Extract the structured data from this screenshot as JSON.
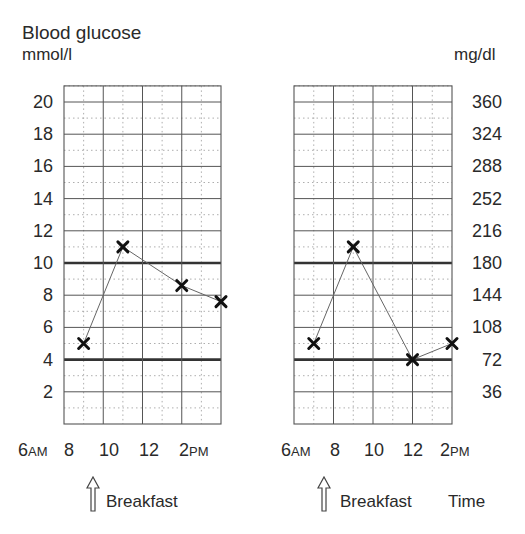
{
  "title": "Blood glucose",
  "unit_left": "mmol/l",
  "unit_right": "mg/dl",
  "y_ticks_left": [
    "20",
    "18",
    "16",
    "14",
    "12",
    "10",
    "8",
    "6",
    "4",
    "2"
  ],
  "y_ticks_right": [
    "360",
    "324",
    "288",
    "252",
    "216",
    "180",
    "144",
    "108",
    "72",
    "36"
  ],
  "x_ticks": [
    {
      "num": "6",
      "suffix": "AM"
    },
    {
      "num": "8",
      "suffix": ""
    },
    {
      "num": "10",
      "suffix": ""
    },
    {
      "num": "12",
      "suffix": ""
    },
    {
      "num": "2",
      "suffix": "PM"
    }
  ],
  "left_chart": {
    "annotation": "Breakfast"
  },
  "right_chart": {
    "annotation": "Breakfast",
    "x_axis_label": "Time"
  },
  "colors": {
    "grid": "#555555",
    "threshold": "#333333",
    "line": "#666666",
    "marker": "#111111"
  },
  "chart_data": [
    {
      "type": "line",
      "title": "Blood glucose",
      "xlabel": "",
      "ylabel": "mmol/l",
      "x": [
        "7AM",
        "9AM",
        "12PM",
        "2PM"
      ],
      "series": [
        {
          "name": "Blood glucose (mmol/l)",
          "values": [
            5.0,
            11.0,
            8.6,
            7.6
          ]
        }
      ],
      "xlim": [
        "6AM",
        "2PM"
      ],
      "x_tick_labels": [
        "6AM",
        "8",
        "10",
        "12",
        "2PM"
      ],
      "ylim": [
        0,
        21
      ],
      "y_tick_labels": [
        "2",
        "4",
        "6",
        "8",
        "10",
        "12",
        "14",
        "16",
        "18",
        "20"
      ],
      "grid": true,
      "reference_lines": [
        4,
        10
      ],
      "annotations": [
        {
          "text": "Breakfast",
          "x": "7AM",
          "marker": "up-arrow"
        }
      ]
    },
    {
      "type": "line",
      "title": "",
      "xlabel": "Time",
      "ylabel": "mg/dl",
      "x": [
        "7AM",
        "9AM",
        "12PM",
        "2PM"
      ],
      "series": [
        {
          "name": "Blood glucose (mg/dl)",
          "values": [
            90,
            198,
            72,
            90
          ]
        }
      ],
      "xlim": [
        "6AM",
        "2PM"
      ],
      "x_tick_labels": [
        "6AM",
        "8",
        "10",
        "12",
        "2PM"
      ],
      "ylim": [
        0,
        378
      ],
      "y_tick_labels": [
        "36",
        "72",
        "108",
        "144",
        "180",
        "216",
        "252",
        "288",
        "324",
        "360"
      ],
      "grid": true,
      "reference_lines": [
        72,
        180
      ],
      "annotations": [
        {
          "text": "Breakfast",
          "x": "7AM",
          "marker": "up-arrow"
        }
      ]
    }
  ]
}
